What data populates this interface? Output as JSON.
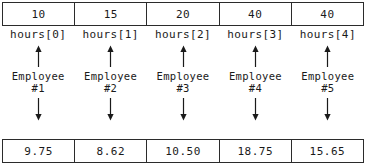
{
  "diagram": {
    "ink_color": "#1a1a1a",
    "border_color": "#2b2b2b",
    "background": "#ffffff",
    "arrow_up_name": "arrow-up-icon",
    "arrow_down_name": "arrow-down-icon"
  },
  "hours_array": {
    "name": "hours",
    "values": [
      "10",
      "15",
      "20",
      "40",
      "40"
    ],
    "index_labels": [
      "hours[0]",
      "hours[1]",
      "hours[2]",
      "hours[3]",
      "hours[4]"
    ]
  },
  "entities": [
    {
      "name": "Employee",
      "id": "#1"
    },
    {
      "name": "Employee",
      "id": "#2"
    },
    {
      "name": "Employee",
      "id": "#3"
    },
    {
      "name": "Employee",
      "id": "#4"
    },
    {
      "name": "Employee",
      "id": "#5"
    }
  ],
  "pay_array": {
    "values": [
      "9.75",
      "8.62",
      "10.50",
      "18.75",
      "15.65"
    ]
  }
}
